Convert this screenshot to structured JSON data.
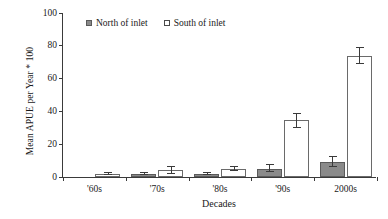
{
  "chart_data": {
    "type": "bar",
    "title": "",
    "xlabel": "Decades",
    "ylabel": "Mean APUE per Year * 100",
    "categories": [
      "'60s",
      "'70s",
      "'80s",
      "'90s",
      "2000s"
    ],
    "ylim": [
      0,
      100
    ],
    "yticks": [
      0,
      20,
      40,
      60,
      80,
      100
    ],
    "grid": false,
    "legend_position": "top-left-inside",
    "series": [
      {
        "name": "North of inlet",
        "color": "#8a8a8a",
        "values": [
          0,
          2,
          2,
          5,
          9
        ],
        "error_low": [
          0,
          1,
          1.5,
          3,
          6
        ],
        "error_high": [
          0,
          3,
          3,
          8,
          13
        ]
      },
      {
        "name": "South of inlet",
        "color": "#ffffff",
        "values": [
          2,
          4,
          5,
          35,
          74
        ],
        "error_low": [
          1.5,
          2,
          3.5,
          30,
          69
        ],
        "error_high": [
          3,
          6.5,
          7,
          39,
          79
        ]
      }
    ]
  },
  "axes": {
    "y_title": "Mean APUE per Year * 100",
    "x_title": "Decades",
    "y_tick_labels": [
      "0",
      "20",
      "40",
      "60",
      "80",
      "100"
    ],
    "x_tick_labels": [
      "'60s",
      "'70s",
      "'80s",
      "'90s",
      "2000s"
    ]
  },
  "legend": {
    "items": [
      {
        "label": "North of inlet",
        "swatch": "filled-gray-square"
      },
      {
        "label": "South of inlet",
        "swatch": "open-white-square"
      }
    ]
  },
  "colors": {
    "north_fill": "#8a8a8a",
    "south_fill": "#ffffff",
    "axis": "#3a3a3a",
    "text": "#1a1a1a",
    "background": "#ffffff"
  }
}
